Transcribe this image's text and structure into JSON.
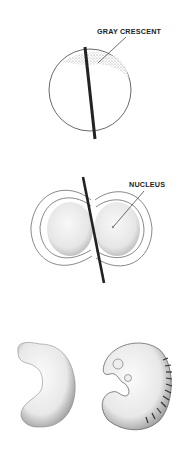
{
  "figure": {
    "panels": [
      {
        "id": "fertilized-egg",
        "label": "GRAY CRESCENT"
      },
      {
        "id": "first-cleavage",
        "label": "NUCLEUS"
      },
      {
        "id": "embryos"
      }
    ]
  }
}
